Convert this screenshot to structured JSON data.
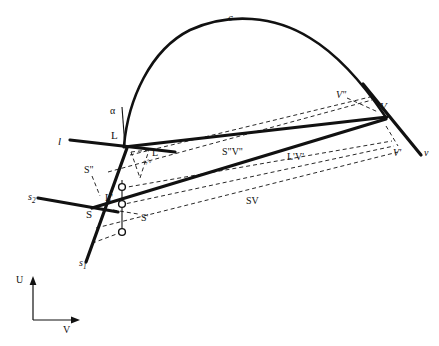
{
  "figure": {
    "width": 439,
    "height": 346,
    "background_color": "#ffffff",
    "ink_color": "#111111",
    "thick_stroke_width": 3.2,
    "thin_stroke_width": 1.1,
    "dashed_stroke_width": 0.9,
    "dash_pattern": "4 3"
  },
  "curve": {
    "name": "c",
    "label": "c",
    "label_x": 228,
    "label_y": 12,
    "description": "arch-shaped curve rising steeply from L, apex near x=240, descending to V",
    "path": "M 124 146 C 128 100 150 50 190 30 C 230 12 275 16 310 38 C 340 56 366 88 385 116"
  },
  "points": [
    {
      "id": "L",
      "label": "L",
      "x": 124,
      "y": 146,
      "label_x": 112,
      "label_y": 131,
      "style": "upright",
      "marker": "none"
    },
    {
      "id": "S",
      "label": "S",
      "x": 93,
      "y": 207,
      "label_x": 86,
      "label_y": 210,
      "style": "upright",
      "marker": "none"
    },
    {
      "id": "V",
      "label": "V",
      "x": 385,
      "y": 116,
      "label_x": 381,
      "label_y": 103,
      "style": "italic",
      "marker": "none"
    },
    {
      "id": "1",
      "label": "1",
      "x": 122,
      "y": 187,
      "label_x": 130,
      "label_y": 183,
      "style": "upright",
      "marker": "circle"
    },
    {
      "id": "2",
      "label": "2",
      "x": 122,
      "y": 204,
      "label_x": 130,
      "label_y": 201,
      "style": "upright",
      "marker": "circle"
    },
    {
      "id": "3",
      "label": "3",
      "x": 122,
      "y": 232,
      "label_x": 118,
      "label_y": 238,
      "style": "upright",
      "marker": "circle"
    }
  ],
  "labels": [
    {
      "id": "c",
      "text": "c",
      "x": 228,
      "y": 12,
      "style": "italic",
      "size": 11
    },
    {
      "id": "alpha",
      "text": "α",
      "x": 110,
      "y": 106,
      "style": "upright",
      "size": 10
    },
    {
      "id": "L",
      "text": "L",
      "x": 111,
      "y": 130,
      "style": "upright",
      "size": 11
    },
    {
      "id": "l",
      "text": "l",
      "x": 58,
      "y": 136,
      "style": "italic",
      "size": 11
    },
    {
      "id": "L2",
      "text": "L\"",
      "x": 152,
      "y": 148,
      "style": "upright",
      "size": 10
    },
    {
      "id": "S2",
      "text": "S\"",
      "x": 84,
      "y": 165,
      "style": "upright",
      "size": 10
    },
    {
      "id": "s2-rot",
      "text": "s₂",
      "x": 141,
      "y": 162,
      "style": "italic",
      "size": 8
    },
    {
      "id": "Lprime",
      "text": "L'",
      "x": 105,
      "y": 193,
      "style": "upright",
      "size": 10
    },
    {
      "id": "Sprime",
      "text": "S'",
      "x": 141,
      "y": 213,
      "style": "upright",
      "size": 10
    },
    {
      "id": "S",
      "text": "S",
      "x": 86,
      "y": 209,
      "style": "upright",
      "size": 11
    },
    {
      "id": "s2",
      "text": "s₂",
      "x": 28,
      "y": 192,
      "style": "italic",
      "size": 10
    },
    {
      "id": "s1",
      "text": "s₁",
      "x": 79,
      "y": 258,
      "style": "italic",
      "size": 10
    },
    {
      "id": "S2V2",
      "text": "S\"V\"",
      "x": 222,
      "y": 147,
      "style": "upright",
      "size": 10
    },
    {
      "id": "LprimeVprime",
      "text": "L'V'",
      "x": 287,
      "y": 152,
      "style": "upright",
      "size": 10
    },
    {
      "id": "SV",
      "text": "SV",
      "x": 246,
      "y": 196,
      "style": "upright",
      "size": 10
    },
    {
      "id": "V2",
      "text": "V\"",
      "x": 336,
      "y": 90,
      "style": "italic",
      "size": 10
    },
    {
      "id": "V",
      "text": "V",
      "x": 380,
      "y": 101,
      "style": "italic",
      "size": 11
    },
    {
      "id": "Vprime",
      "text": "V'",
      "x": 393,
      "y": 148,
      "style": "italic",
      "size": 10
    },
    {
      "id": "v",
      "text": "v",
      "x": 424,
      "y": 148,
      "style": "italic",
      "size": 10
    },
    {
      "id": "axis-U",
      "text": "U",
      "x": 16,
      "y": 275,
      "style": "upright",
      "size": 10
    },
    {
      "id": "axis-V",
      "text": "V",
      "x": 63,
      "y": 325,
      "style": "upright",
      "size": 10
    }
  ],
  "thick_lines": [
    {
      "id": "line-l",
      "name": "line l through L",
      "x1": 70,
      "y1": 140,
      "x2": 175,
      "y2": 152
    },
    {
      "id": "line-L-V",
      "name": "upper thick line L to V",
      "x1": 124,
      "y1": 147,
      "x2": 387,
      "y2": 117
    },
    {
      "id": "line-S-V",
      "name": "lower thick line S to V",
      "x1": 92,
      "y1": 208,
      "x2": 386,
      "y2": 119
    },
    {
      "id": "line-s2",
      "name": "trace line s2",
      "x1": 38,
      "y1": 198,
      "x2": 118,
      "y2": 212
    },
    {
      "id": "line-s1",
      "name": "trace line s1",
      "x1": 127,
      "y1": 148,
      "x2": 86,
      "y2": 262
    },
    {
      "id": "line-v",
      "name": "vertical trace v at V",
      "x1": 363,
      "y1": 84,
      "x2": 421,
      "y2": 155
    }
  ],
  "thin_lines": [
    {
      "id": "alpha-ref",
      "name": "vertical reference line for angle alpha",
      "x1": 122,
      "y1": 107,
      "x2": 125,
      "y2": 147
    },
    {
      "id": "tick-1-3",
      "name": "vertical tick chain through points 1,2,3",
      "x1": 122,
      "y1": 180,
      "x2": 122,
      "y2": 236
    }
  ],
  "dashed_lines": [
    {
      "id": "d-L2-V2",
      "name": "dashed L\" to V\"",
      "x1": 130,
      "y1": 155,
      "x2": 370,
      "y2": 97
    },
    {
      "id": "d-S2-V2",
      "name": "dashed S\" to V\" upper",
      "x1": 108,
      "y1": 172,
      "x2": 372,
      "y2": 100
    },
    {
      "id": "d-Lp-Vp",
      "name": "dashed L' to V'",
      "x1": 122,
      "y1": 188,
      "x2": 392,
      "y2": 141
    },
    {
      "id": "d-Sp-Vp",
      "name": "dashed S' to V' lower",
      "x1": 120,
      "y1": 205,
      "x2": 394,
      "y2": 146
    },
    {
      "id": "d-S-V",
      "name": "dashed S to V bottom (SV)",
      "x1": 96,
      "y1": 228,
      "x2": 398,
      "y2": 152
    },
    {
      "id": "d-3-S",
      "name": "dashed from point 3 to s1",
      "x1": 122,
      "y1": 232,
      "x2": 90,
      "y2": 244
    },
    {
      "id": "d-tri-a",
      "name": "small dashed triangle side a",
      "x1": 131,
      "y1": 152,
      "x2": 149,
      "y2": 150
    },
    {
      "id": "d-tri-b",
      "name": "small dashed triangle side b",
      "x1": 131,
      "y1": 152,
      "x2": 140,
      "y2": 178
    },
    {
      "id": "d-tri-c",
      "name": "small dashed triangle side c",
      "x1": 140,
      "y1": 178,
      "x2": 149,
      "y2": 150
    },
    {
      "id": "d-S2-tick",
      "name": "dashed tick below S\"",
      "x1": 92,
      "y1": 176,
      "x2": 100,
      "y2": 196
    },
    {
      "id": "d-Sp-tick",
      "name": "dashed tick toward S'",
      "x1": 113,
      "y1": 210,
      "x2": 138,
      "y2": 214
    },
    {
      "id": "d-V2-tick",
      "name": "dashed tick at V\"",
      "x1": 347,
      "y1": 98,
      "x2": 378,
      "y2": 112
    },
    {
      "id": "d-Vp-tick",
      "name": "dashed tick at V'",
      "x1": 386,
      "y1": 126,
      "x2": 398,
      "y2": 146
    }
  ],
  "axes": {
    "name": "U-V coordinate axes (lower left)",
    "origin_x": 33,
    "origin_y": 320,
    "u_label": "U",
    "u_tip_x": 33,
    "u_tip_y": 276,
    "v_label": "V",
    "v_tip_x": 80,
    "v_tip_y": 320
  }
}
